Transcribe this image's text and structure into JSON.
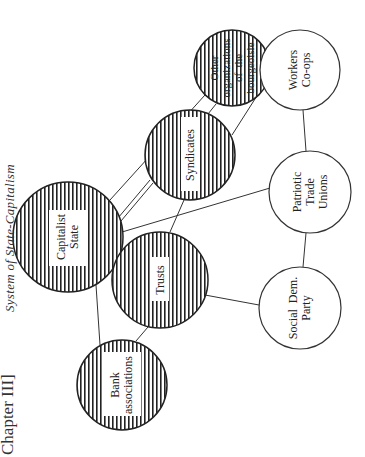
{
  "page": {
    "chapter_label": "Chapter III]",
    "figure_title": "System of State-Capitalism"
  },
  "diagram": {
    "nodes": [
      {
        "id": "capitalist_state",
        "lines": [
          "Capitalist",
          "State"
        ],
        "hatched": true
      },
      {
        "id": "other_orgs",
        "lines": [
          "Other",
          "organizations",
          "of  the",
          "bourgeoisie"
        ],
        "hatched": true
      },
      {
        "id": "syndicates",
        "lines": [
          "Syndicates"
        ],
        "hatched": true
      },
      {
        "id": "trusts",
        "lines": [
          "Trusts"
        ],
        "hatched": true
      },
      {
        "id": "bank_associations",
        "lines": [
          "Bank",
          "associations"
        ],
        "hatched": true
      },
      {
        "id": "workers_coops",
        "lines": [
          "Workers",
          "Co-ops"
        ],
        "hatched": false
      },
      {
        "id": "patriotic_unions",
        "lines": [
          "Patriotic",
          "Trade",
          "Unions"
        ],
        "hatched": false
      },
      {
        "id": "social_dem",
        "lines": [
          "Social  Dem.",
          "Party"
        ],
        "hatched": false
      }
    ],
    "edges": [
      [
        "capitalist_state",
        "other_orgs"
      ],
      [
        "capitalist_state",
        "syndicates"
      ],
      [
        "capitalist_state",
        "trusts"
      ],
      [
        "capitalist_state",
        "bank_associations"
      ],
      [
        "capitalist_state",
        "patriotic_unions"
      ],
      [
        "syndicates",
        "other_orgs"
      ],
      [
        "syndicates",
        "trusts"
      ],
      [
        "syndicates",
        "workers_coops"
      ],
      [
        "trusts",
        "bank_associations"
      ],
      [
        "trusts",
        "social_dem"
      ],
      [
        "patriotic_unions",
        "workers_coops"
      ],
      [
        "patriotic_unions",
        "social_dem"
      ]
    ]
  }
}
